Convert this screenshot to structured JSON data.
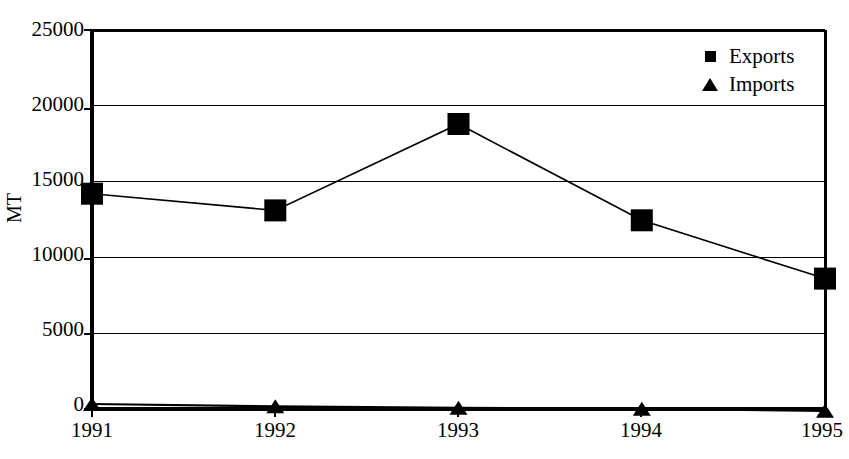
{
  "chart_data": {
    "type": "line",
    "title": "",
    "xlabel": "",
    "ylabel": "MT",
    "categories": [
      "1991",
      "1992",
      "1993",
      "1994",
      "1995"
    ],
    "ylim": [
      0,
      25000
    ],
    "y_ticks": [
      "0",
      "5000",
      "10000",
      "15000",
      "20000",
      "25000"
    ],
    "y_tick_values": [
      0,
      5000,
      10000,
      15000,
      20000,
      25000
    ],
    "grid": true,
    "legend_position": "top-right-inside",
    "series": [
      {
        "name": "Exports",
        "marker": "square",
        "color": "#000000",
        "values": [
          14200,
          13100,
          18800,
          12450,
          8600
        ]
      },
      {
        "name": "Imports",
        "marker": "triangle",
        "color": "#000000",
        "values": [
          330,
          180,
          80,
          20,
          -120
        ]
      }
    ]
  },
  "legend": {
    "items": [
      {
        "label": "Exports",
        "marker": "square-marker-icon"
      },
      {
        "label": "Imports",
        "marker": "triangle-marker-icon"
      }
    ]
  },
  "axes": {
    "y_title": "MT",
    "y_labels": [
      "25000",
      "20000",
      "15000",
      "10000",
      "5000",
      "0"
    ],
    "x_labels": [
      "1991",
      "1992",
      "1993",
      "1994",
      "1995"
    ]
  },
  "title": {
    "text": ""
  }
}
